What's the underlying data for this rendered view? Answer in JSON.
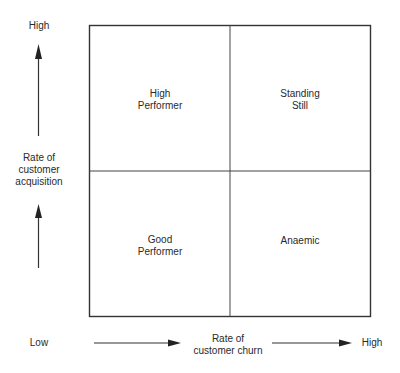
{
  "diagram": {
    "type": "2x2 matrix",
    "y_axis": {
      "label_line1": "Rate of",
      "label_line2": "customer",
      "label_line3": "acquisition",
      "high_label": "High"
    },
    "x_axis": {
      "label_line1": "Rate of",
      "label_line2": "customer churn",
      "low_label": "Low",
      "high_label": "High"
    },
    "quadrants": {
      "top_left": {
        "line1": "High",
        "line2": "Performer"
      },
      "top_right": {
        "line1": "Standing",
        "line2": "Still"
      },
      "bottom_left": {
        "line1": "Good",
        "line2": "Performer"
      },
      "bottom_right": {
        "line1": "Anaemic",
        "line2": ""
      }
    },
    "colors": {
      "line": "#333333",
      "background": "#ffffff",
      "text": "#2a2a2a"
    }
  }
}
